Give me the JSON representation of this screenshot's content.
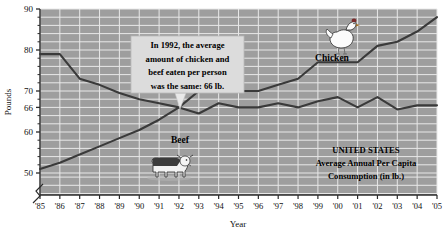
{
  "chart_data": {
    "type": "line",
    "title": "",
    "xlabel": "Year",
    "ylabel": "Pounds",
    "ylim": [
      48,
      90
    ],
    "ytick_labels": [
      "90",
      "80",
      "70",
      "66",
      "60",
      "50"
    ],
    "ytick_values": [
      90,
      80,
      70,
      66,
      60,
      50
    ],
    "grid": true,
    "axis_break": true,
    "legend": "inline-labels",
    "categories": [
      "'85",
      "'86",
      "'87",
      "'88",
      "'89",
      "'90",
      "'91",
      "'92",
      "'93",
      "'94",
      "'95",
      "'96",
      "'97",
      "'98",
      "'99",
      "'00",
      "'01",
      "'02",
      "'03",
      "'04",
      "'05"
    ],
    "series": [
      {
        "name": "Beef",
        "label": "Beef",
        "values": [
          79,
          79,
          73,
          71.5,
          69.5,
          68,
          67,
          66,
          64.5,
          67,
          66,
          66,
          67,
          66,
          67.5,
          68.5,
          66,
          68.5,
          65.5,
          66.5,
          66.5
        ]
      },
      {
        "name": "Chicken",
        "label": "Chicken",
        "values": [
          51,
          52.5,
          54.5,
          56.5,
          58.5,
          60.5,
          63,
          66,
          70,
          70.5,
          70,
          70,
          71.5,
          73,
          77,
          77,
          77,
          81,
          82,
          84.5,
          88
        ]
      }
    ],
    "annotations": [
      {
        "name": "callout",
        "lines": [
          "In 1992, the average",
          "amount of chicken and",
          "beef eaten per person",
          "was the same: 66 lb."
        ],
        "points_to_year": "'92",
        "points_to_value": 66
      },
      {
        "name": "caption",
        "lines": [
          "UNITED STATES",
          "Average Annual Per Capita",
          "Consumption (in lb.)"
        ]
      }
    ],
    "icons": [
      {
        "name": "chicken-icon",
        "near_series": "Chicken"
      },
      {
        "name": "cow-icon",
        "near_series": "Beef"
      }
    ]
  },
  "colors": {
    "plot_background": "#9e9e9e",
    "gridline": "#e8e8e8",
    "line": "#3a3a3a",
    "axis": "#2b2b2b",
    "callout_background": "#dcdcdc",
    "text": "#000000"
  }
}
